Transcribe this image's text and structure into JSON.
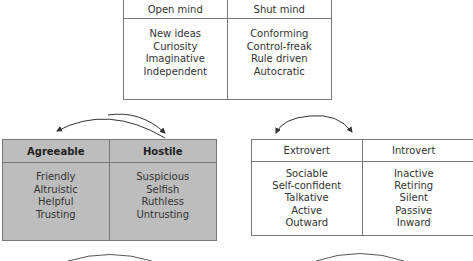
{
  "dimensions": [
    {
      "id": "openness",
      "left": {
        "title": "Open mind",
        "traits": [
          "New ideas",
          "Curiosity",
          "Imaginative",
          "Independent"
        ]
      },
      "right": {
        "title": "Shut mind",
        "traits": [
          "Conforming",
          "Control-freak",
          "Rule driven",
          "Autocratic"
        ]
      }
    },
    {
      "id": "agreeableness",
      "highlighted": true,
      "fill_color": "#bdbdbd",
      "left": {
        "title": "Agreeable",
        "traits": [
          "Friendly",
          "Altruistic",
          "Helpful",
          "Trusting"
        ]
      },
      "right": {
        "title": "Hostile",
        "traits": [
          "Suspicious",
          "Selfish",
          "Ruthless",
          "Untrusting"
        ]
      }
    },
    {
      "id": "extraversion",
      "left": {
        "title": "Extrovert",
        "traits": [
          "Sociable",
          "Self-confident",
          "Talkative",
          "Active",
          "Outward"
        ]
      },
      "right": {
        "title": "Introvert",
        "traits": [
          "Inactive",
          "Retiring",
          "Silent",
          "Passive",
          "Inward"
        ]
      }
    }
  ]
}
